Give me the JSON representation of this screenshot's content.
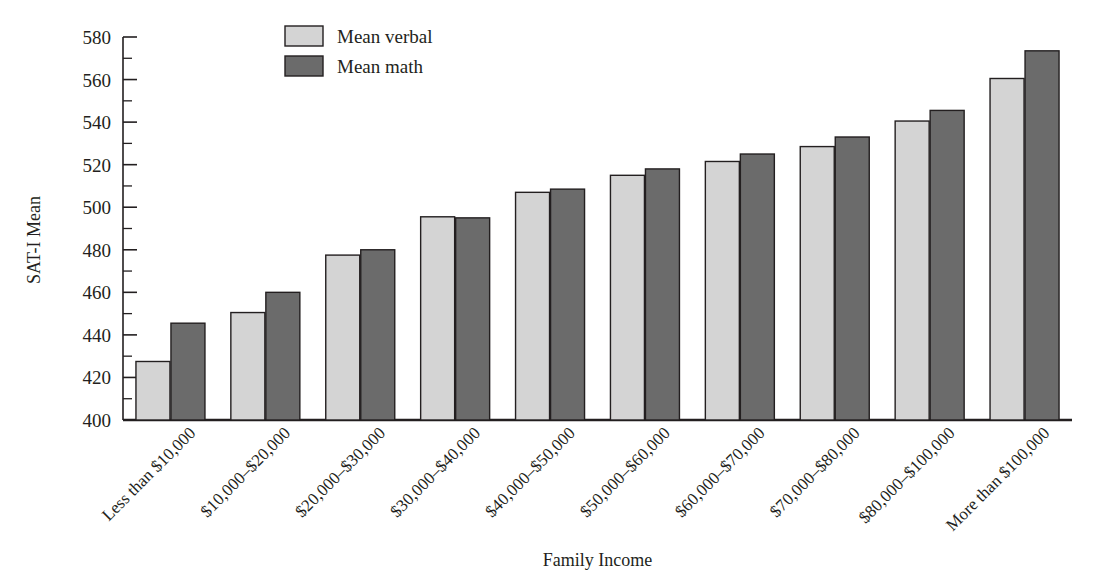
{
  "chart_data": {
    "type": "bar",
    "title": "",
    "xlabel": "Family Income",
    "ylabel": "SAT-I Mean",
    "ylim": [
      400,
      580
    ],
    "ytick_step": 20,
    "yminor_step": 10,
    "grid": false,
    "legend_position": "top-center",
    "yticks": [
      "400",
      "420",
      "440",
      "460",
      "480",
      "500",
      "520",
      "540",
      "560",
      "580"
    ],
    "categories": [
      "Less than $10,000",
      "$10,000–$20,000",
      "$20,000–$30,000",
      "$30,000–$40,000",
      "$40,000–$50,000",
      "$50,000–$60,000",
      "$60,000–$70,000",
      "$70,000–$80,000",
      "$80,000–$100,000",
      "More than $100,000"
    ],
    "series": [
      {
        "name": "Mean verbal",
        "color": "#d4d4d4",
        "values": [
          427.5,
          450.5,
          477.5,
          495.5,
          507,
          515,
          521.5,
          528.5,
          540.5,
          560.5
        ]
      },
      {
        "name": "Mean math",
        "color": "#6b6b6b",
        "values": [
          445.5,
          460,
          480,
          495,
          508.5,
          518,
          525,
          533,
          545.5,
          573.5
        ]
      }
    ]
  },
  "legend": {
    "items": [
      {
        "label": "Mean verbal",
        "color": "#d4d4d4"
      },
      {
        "label": "Mean math",
        "color": "#6b6b6b"
      }
    ]
  },
  "style": {
    "axis_color": "#231f20",
    "bar_stroke": "#231f20",
    "background": "#ffffff"
  }
}
